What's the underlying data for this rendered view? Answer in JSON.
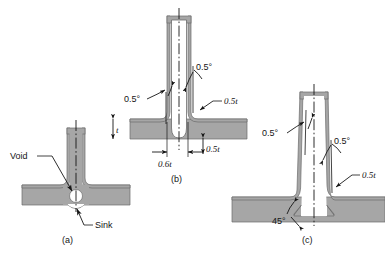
{
  "figure": {
    "background_color": "#ffffff",
    "material_fill": "#a6a6a6",
    "material_stroke": "#6b6b6b",
    "line_color": "#151515",
    "void_fill": "#ffffff"
  },
  "panels": [
    {
      "id": "a",
      "caption": "(a)",
      "description": "Thick rib on base wall producing an internal void and an external sink mark",
      "annotations": [
        {
          "name": "void",
          "text": "Void"
        },
        {
          "name": "sink",
          "text": "Sink"
        }
      ]
    },
    {
      "id": "b",
      "caption": "(b)",
      "description": "Cored rib with draft angles and fillet radii",
      "annotations": [
        {
          "name": "draft-left",
          "text": "0.5°"
        },
        {
          "name": "draft-right",
          "text": "0.5°"
        },
        {
          "name": "fillet-radius",
          "text": "0.5t"
        },
        {
          "name": "wall-thickness",
          "text": "t"
        },
        {
          "name": "rib-width",
          "text": "0.6t"
        },
        {
          "name": "base-radius",
          "text": "0.5t"
        }
      ]
    },
    {
      "id": "c",
      "caption": "(c)",
      "description": "Tapered rib with 45 degree relief at the base and draft angles",
      "annotations": [
        {
          "name": "draft-left",
          "text": "0.5°"
        },
        {
          "name": "draft-right",
          "text": "0.5°"
        },
        {
          "name": "fillet-radius",
          "text": "0.5t"
        },
        {
          "name": "base-angle",
          "text": "45°"
        }
      ]
    }
  ]
}
